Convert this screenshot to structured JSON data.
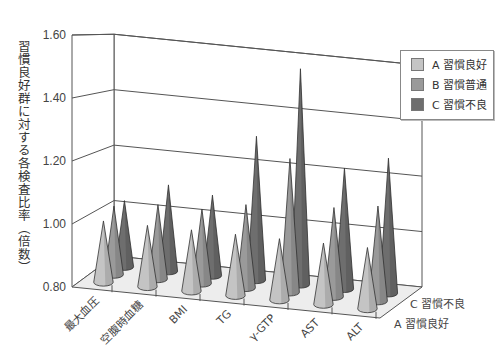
{
  "chart_data": {
    "type": "bar",
    "subtype": "3d-cone",
    "title": "",
    "ylabel": "習慣良好群に対する各検査比率（倍数）",
    "xlabel": "",
    "ylim": [
      0.8,
      1.6
    ],
    "yticks": [
      "0.80",
      "1.00",
      "1.20",
      "1.40",
      "1.60"
    ],
    "grid": true,
    "legend_position": "upper-right",
    "categories": [
      "最大血圧",
      "空腹時血糖",
      "BMI",
      "TG",
      "γ-GTP",
      "AST",
      "ALT"
    ],
    "depth_axis_labels": [
      "A 習慣良好",
      "C 習慣不良"
    ],
    "series": [
      {
        "name": "A 習慣良好",
        "color": "#c4c4c4",
        "values": [
          1.0,
          1.0,
          1.0,
          1.0,
          1.0,
          1.0,
          1.0
        ]
      },
      {
        "name": "B 習慣普通",
        "color": "#9a9a9a",
        "values": [
          1.03,
          1.05,
          1.05,
          1.08,
          1.25,
          1.1,
          1.12
        ]
      },
      {
        "name": "C 習慣不良",
        "color": "#6e6e6e",
        "values": [
          1.03,
          1.1,
          1.08,
          1.3,
          1.55,
          1.22,
          1.27
        ]
      }
    ]
  },
  "labels": {
    "ylabel": "習慣良好群に対する各検査比率（倍数）",
    "legend": [
      "A 習慣良好",
      "B 習慣普通",
      "C 習慣不良"
    ],
    "depth_back": "C 習慣不良",
    "depth_front": "A 習慣良好"
  }
}
